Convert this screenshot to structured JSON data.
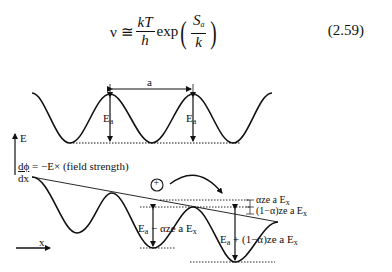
{
  "equation": {
    "lhs": "ν ≅",
    "frac1_num": "kT",
    "frac1_den": "h",
    "func": "exp",
    "frac2_num": "S",
    "frac2_num_sub": "a",
    "frac2_den": "k",
    "number": "(2.59)"
  },
  "top_diagram": {
    "spacing_label": "a",
    "barrier_label_1": "E",
    "barrier_label_1_sub": "a",
    "barrier_label_2": "E",
    "barrier_label_2_sub": "a"
  },
  "bottom_diagram": {
    "axis_label_e": "E",
    "axis_label_x": "x",
    "field_eq_num": "dϕ",
    "field_eq_rest": " = −E× (field strength)",
    "field_eq_den": "dx",
    "ion_symbol": "+",
    "label_alpha": "αze a E",
    "label_alpha_sub": "x",
    "label_one_minus_alpha": "(1−α)ze a E",
    "label_one_minus_alpha_sub": "x",
    "forward_barrier": "E",
    "forward_barrier_sub": "a",
    "forward_barrier_rest": " − αze a E",
    "forward_barrier_rest_sub": "x",
    "reverse_barrier": "E",
    "reverse_barrier_sub": "a",
    "reverse_barrier_rest": " + (1−α)ze a E",
    "reverse_barrier_rest_sub": "x"
  }
}
